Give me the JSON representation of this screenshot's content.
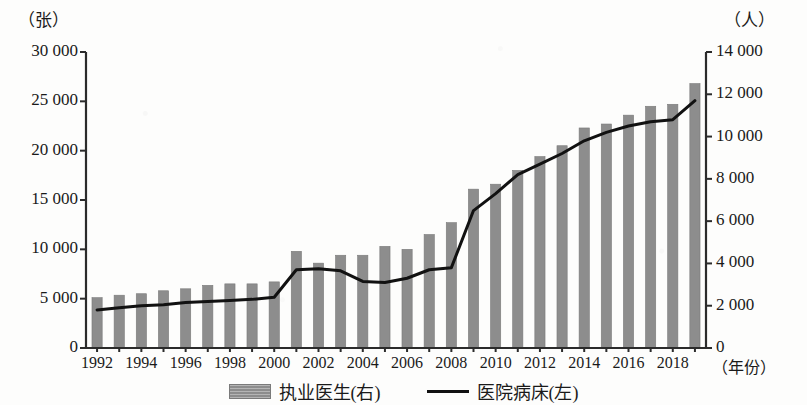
{
  "axes": {
    "left_unit": "（张）",
    "right_unit": "（人）",
    "x_unit": "（年份）",
    "left_ticks": [
      "30 000",
      "25 000",
      "20 000",
      "15 000",
      "10 000",
      "5 000",
      "0"
    ],
    "right_ticks": [
      "14 000",
      "12 000",
      "10 000",
      "8 000",
      "6 000",
      "4 000",
      "2 000",
      "0"
    ],
    "x_ticks": [
      "1992",
      "1994",
      "1996",
      "1998",
      "2000",
      "2002",
      "2004",
      "2006",
      "2008",
      "2010",
      "2012",
      "2014",
      "2016",
      "2018"
    ]
  },
  "legend": {
    "bar_label": "执业医生(右)",
    "line_label": "医院病床(左)"
  },
  "colors": {
    "bar_fill": "#8d8d8d",
    "bar_stroke": "#7a7a7a",
    "line": "#111111",
    "axis": "#2b2b2b",
    "background": "#fdfdfc"
  },
  "chart_data": {
    "type": "bar",
    "title": "",
    "subtitle": "",
    "xlabel": "（年份）",
    "ylabel": "（张）",
    "y2label": "（人）",
    "grid": false,
    "legend_position": "bottom",
    "categories": [
      "1992",
      "1993",
      "1994",
      "1995",
      "1996",
      "1997",
      "1998",
      "1999",
      "2000",
      "2001",
      "2002",
      "2003",
      "2004",
      "2005",
      "2006",
      "2007",
      "2008",
      "2009",
      "2010",
      "2011",
      "2012",
      "2013",
      "2014",
      "2015",
      "2016",
      "2017",
      "2018",
      "2019"
    ],
    "ylim": [
      0,
      30000
    ],
    "y2lim": [
      0,
      14000
    ],
    "ytick_step": 5000,
    "y2tick_step": 2000,
    "series": [
      {
        "name": "执业医生(右)",
        "axis": "left",
        "unit": "张",
        "type": "bar",
        "values": [
          5100,
          5350,
          5500,
          5800,
          6000,
          6350,
          6500,
          6500,
          6700,
          9800,
          8600,
          9400,
          9400,
          10300,
          10000,
          11500,
          12700,
          16100,
          16600,
          18000,
          19400,
          20500,
          22300,
          22700,
          23600,
          24500,
          24700,
          26800
        ]
      },
      {
        "name": "医院病床(左)",
        "axis": "right",
        "unit": "人",
        "type": "line",
        "values": [
          1800,
          1900,
          2000,
          2050,
          2150,
          2200,
          2250,
          2300,
          2400,
          3700,
          3750,
          3650,
          3150,
          3100,
          3300,
          3700,
          3800,
          6500,
          7300,
          8200,
          8700,
          9200,
          9800,
          10200,
          10500,
          10700,
          10800,
          11700
        ]
      }
    ]
  }
}
